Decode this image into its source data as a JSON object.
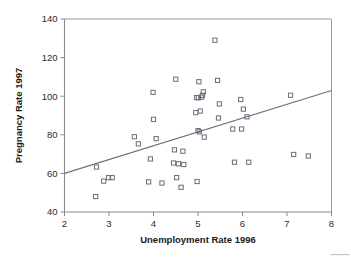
{
  "chart_data": {
    "type": "scatter",
    "title": "",
    "xlabel": "Unemployment Rate 1996",
    "ylabel": "Pregnancy Rate 1997",
    "xlim": [
      2,
      8
    ],
    "ylim": [
      40,
      140
    ],
    "xticks": [
      2,
      3,
      4,
      5,
      6,
      7,
      8
    ],
    "yticks": [
      40,
      60,
      80,
      100,
      120,
      140
    ],
    "xtick_labels": [
      "2",
      "3",
      "4",
      "5",
      "6",
      "7",
      "8"
    ],
    "ytick_labels": [
      "40",
      "60",
      "80",
      "100",
      "120",
      "140"
    ],
    "grid": false,
    "legend": null,
    "marker": "open-square",
    "marker_color": "#6b6b7a",
    "points": [
      [
        2.7,
        48.0
      ],
      [
        2.72,
        63.3
      ],
      [
        2.88,
        56.0
      ],
      [
        2.99,
        57.8
      ],
      [
        3.07,
        57.8
      ],
      [
        3.57,
        79.0
      ],
      [
        3.66,
        75.3
      ],
      [
        3.89,
        55.6
      ],
      [
        3.93,
        67.5
      ],
      [
        3.99,
        102.0
      ],
      [
        4.0,
        88.0
      ],
      [
        4.06,
        78.0
      ],
      [
        4.19,
        55.0
      ],
      [
        4.45,
        65.4
      ],
      [
        4.47,
        72.2
      ],
      [
        4.5,
        108.8
      ],
      [
        4.52,
        57.8
      ],
      [
        4.56,
        65.0
      ],
      [
        4.62,
        52.8
      ],
      [
        4.66,
        71.5
      ],
      [
        4.68,
        64.6
      ],
      [
        4.95,
        91.5
      ],
      [
        4.97,
        99.3
      ],
      [
        4.98,
        55.8
      ],
      [
        5.0,
        82.2
      ],
      [
        5.01,
        99.2
      ],
      [
        5.02,
        107.5
      ],
      [
        5.03,
        81.5
      ],
      [
        5.05,
        92.3
      ],
      [
        5.08,
        99.5
      ],
      [
        5.1,
        100.5
      ],
      [
        5.12,
        102.3
      ],
      [
        5.14,
        78.8
      ],
      [
        5.38,
        129.0
      ],
      [
        5.44,
        108.2
      ],
      [
        5.46,
        88.7
      ],
      [
        5.48,
        96.0
      ],
      [
        5.78,
        83.0
      ],
      [
        5.82,
        65.8
      ],
      [
        5.96,
        98.3
      ],
      [
        5.98,
        83.0
      ],
      [
        6.02,
        93.3
      ],
      [
        6.1,
        89.3
      ],
      [
        6.14,
        65.8
      ],
      [
        7.08,
        100.5
      ],
      [
        7.15,
        69.8
      ],
      [
        7.48,
        69.0
      ]
    ],
    "trend_line": {
      "x": [
        2,
        8
      ],
      "y": [
        60.0,
        103.0
      ],
      "slope": 7.17,
      "intercept": 45.67
    }
  }
}
